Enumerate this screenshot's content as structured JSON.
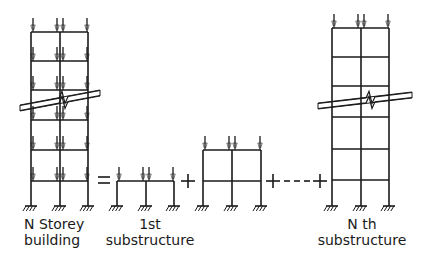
{
  "colors": {
    "ink": "#1a1a1a",
    "background": "#ffffff"
  },
  "labels": {
    "building": {
      "line1": "N Storey",
      "line2": "building"
    },
    "first": {
      "line1": "1st",
      "line2": "substructure"
    },
    "nth": {
      "line1": "N th",
      "line2": "substructure"
    }
  },
  "operators": {
    "equals": "=",
    "plus1": "+",
    "plus2": "+",
    "ellipsis": "- - -",
    "plus3": "+"
  },
  "frames": [
    {
      "id": "n-storey-building",
      "columns": [
        31,
        60,
        88
      ],
      "beams": [
        32,
        61,
        90,
        120,
        150,
        181
      ],
      "base": 206,
      "loaded_beams": [
        32,
        61,
        90,
        120,
        150,
        181
      ],
      "break": {
        "x1": 20,
        "y1": 108,
        "x2": 100,
        "y2": 93,
        "zig_x": 63
      }
    },
    {
      "id": "first-substructure",
      "columns": [
        117,
        146,
        174
      ],
      "beams": [
        181
      ],
      "base": 206,
      "loaded_beams": [
        181
      ]
    },
    {
      "id": "second-substructure",
      "columns": [
        203,
        232,
        261
      ],
      "beams": [
        150,
        181
      ],
      "base": 206,
      "loaded_beams": [
        150
      ]
    },
    {
      "id": "nth-substructure",
      "columns": [
        332,
        361,
        389
      ],
      "beams": [
        28,
        57,
        86,
        117,
        149,
        180
      ],
      "base": 206,
      "loaded_beams": [
        28
      ],
      "break": {
        "x1": 318,
        "y1": 106,
        "x2": 412,
        "y2": 95,
        "zig_x": 370
      }
    }
  ]
}
